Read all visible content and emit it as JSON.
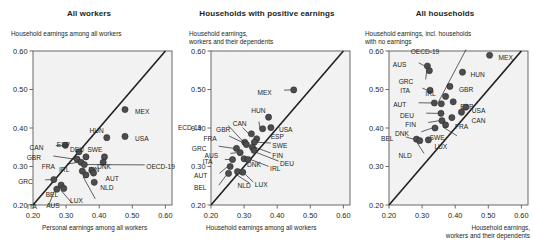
{
  "figure": {
    "axis_ticks": [
      "0.20",
      "0.30",
      "0.40",
      "0.50",
      "0.60"
    ],
    "axis_min": 0.2,
    "axis_max": 0.62,
    "marker_color": "#4d4d4f",
    "line_color": "#231f20",
    "plot_bg": "#f2f2f2"
  },
  "chart_data": [
    {
      "type": "scatter",
      "title": "All workers",
      "ylabel": "Household earnings among all workers",
      "xlabel": "Personal earnings among all workers",
      "xlim": [
        0.2,
        0.62
      ],
      "ylim": [
        0.2,
        0.6
      ],
      "xticks": [
        "0.20",
        "0.30",
        "0.40",
        "0.50",
        "0.60"
      ],
      "yticks": [
        "0.20",
        "0.30",
        "0.40",
        "0.50",
        "0.60"
      ],
      "grid": false,
      "legend": "none",
      "annotations": [
        "45-degree diagonal reference line"
      ],
      "points": [
        {
          "code": "MEX",
          "x": 0.478,
          "y": 0.448,
          "lx": 10,
          "ly": 2.5
        },
        {
          "code": "USA",
          "x": 0.478,
          "y": 0.378,
          "lx": 10,
          "ly": 2.5
        },
        {
          "code": "HUN",
          "x": 0.423,
          "y": 0.375,
          "lx": -3,
          "ly": -7
        },
        {
          "code": "SWE",
          "x": 0.416,
          "y": 0.325,
          "lx": -2,
          "ly": -7
        },
        {
          "code": "CAN",
          "x": 0.298,
          "y": 0.355,
          "lx": -22,
          "ly": 2.5
        },
        {
          "code": "ESP",
          "x": 0.339,
          "y": 0.338,
          "lx": -9,
          "ly": -7
        },
        {
          "code": "DEU",
          "x": 0.36,
          "y": 0.325,
          "lx": -2,
          "ly": -7
        },
        {
          "code": "FIN",
          "x": 0.412,
          "y": 0.311,
          "lx": -4,
          "ly": 7
        },
        {
          "code": "GBR",
          "x": 0.333,
          "y": 0.319,
          "lx": -36,
          "ly": -1
        },
        {
          "code": "FRA",
          "x": 0.345,
          "y": 0.311,
          "lx": -26,
          "ly": 4
        },
        {
          "code": "OECD-19",
          "x": 0.355,
          "y": 0.305,
          "lx": 62,
          "ly": 2.5
        },
        {
          "code": "DNK",
          "x": 0.378,
          "y": 0.29,
          "lx": 5,
          "ly": -4
        },
        {
          "code": "AUT",
          "x": 0.383,
          "y": 0.283,
          "lx": 12,
          "ly": 6
        },
        {
          "code": "IRL",
          "x": 0.349,
          "y": 0.288,
          "lx": -13,
          "ly": -1
        },
        {
          "code": "LUX",
          "x": 0.36,
          "y": 0.278,
          "lx": -3,
          "ly": 26
        },
        {
          "code": "NLD",
          "x": 0.385,
          "y": 0.259,
          "lx": 6,
          "ly": 5
        },
        {
          "code": "GRC",
          "x": 0.263,
          "y": 0.266,
          "lx": -21,
          "ly": 2.5
        },
        {
          "code": "BEL",
          "x": 0.285,
          "y": 0.252,
          "lx": -3,
          "ly": 10
        },
        {
          "code": "AUS",
          "x": 0.293,
          "y": 0.243,
          "lx": -4,
          "ly": 17
        },
        {
          "code": "ITA",
          "x": 0.272,
          "y": 0.241,
          "lx": -20,
          "ly": 17
        }
      ]
    },
    {
      "type": "scatter",
      "title": "Households with positive earnings",
      "ylabel": "Household earnings,\nworkers and their dependents",
      "xlabel": "Household earnings among all workers",
      "xlim": [
        0.2,
        0.62
      ],
      "ylim": [
        0.2,
        0.6
      ],
      "xticks": [
        "0.20",
        "0.30",
        "0.40",
        "0.50",
        "0.60"
      ],
      "yticks": [
        "0.20",
        "0.30",
        "0.40",
        "0.50",
        "0.60"
      ],
      "grid": false,
      "legend": "none",
      "annotations": [
        "45-degree diagonal reference line"
      ],
      "points": [
        {
          "code": "MEX",
          "x": 0.45,
          "y": 0.499,
          "lx": -22,
          "ly": 2.5
        },
        {
          "code": "HUN",
          "x": 0.374,
          "y": 0.428,
          "lx": -3,
          "ly": -7
        },
        {
          "code": "USA",
          "x": 0.381,
          "y": 0.401,
          "lx": 8,
          "ly": 2.5
        },
        {
          "code": "CAN",
          "x": 0.356,
          "y": 0.398,
          "lx": -16,
          "ly": -5
        },
        {
          "code": "GBR",
          "x": 0.322,
          "y": 0.385,
          "lx": -21,
          "ly": -4
        },
        {
          "code": "ESP",
          "x": 0.338,
          "y": 0.372,
          "lx": 14,
          "ly": -2
        },
        {
          "code": "SWE",
          "x": 0.331,
          "y": 0.363,
          "lx": 18,
          "ly": 3
        },
        {
          "code": "FRA",
          "x": 0.302,
          "y": 0.363,
          "lx": -28,
          "ly": -4
        },
        {
          "code": "OECD-19",
          "x": 0.307,
          "y": 0.357,
          "lx": -45,
          "ly": -17
        },
        {
          "code": "FIN",
          "x": 0.325,
          "y": 0.35,
          "lx": 20,
          "ly": 8
        },
        {
          "code": "DEU",
          "x": 0.33,
          "y": 0.342,
          "lx": 26,
          "ly": 13
        },
        {
          "code": "GRC",
          "x": 0.277,
          "y": 0.347,
          "lx": -30,
          "ly": 0
        },
        {
          "code": "AUS",
          "x": 0.288,
          "y": 0.336,
          "lx": -22,
          "ly": 3
        },
        {
          "code": "DNK",
          "x": 0.3,
          "y": 0.32,
          "lx": 3,
          "ly": 6
        },
        {
          "code": "IRL",
          "x": 0.312,
          "y": 0.318,
          "lx": 22,
          "ly": 9
        },
        {
          "code": "ITA",
          "x": 0.265,
          "y": 0.318,
          "lx": -20,
          "ly": 2
        },
        {
          "code": "AUT",
          "x": 0.258,
          "y": 0.3,
          "lx": -23,
          "ly": 9
        },
        {
          "code": "NLD",
          "x": 0.28,
          "y": 0.287,
          "lx": 0,
          "ly": 14
        },
        {
          "code": "LUX",
          "x": 0.296,
          "y": 0.285,
          "lx": 12,
          "ly": 12
        },
        {
          "code": "BEL",
          "x": 0.253,
          "y": 0.282,
          "lx": -22,
          "ly": 14
        }
      ]
    },
    {
      "type": "scatter",
      "title": "All households",
      "ylabel": "Household earnings, incl. households\nwith no earnings",
      "xlabel": "Household earnings,\nworkers and their dependents",
      "xlim": [
        0.2,
        0.62
      ],
      "ylim": [
        0.2,
        0.6
      ],
      "xticks": [
        "0.20",
        "0.30",
        "0.40",
        "0.50",
        "0.60"
      ],
      "yticks": [
        "0.20",
        "0.30",
        "0.40",
        "0.50",
        "0.60"
      ],
      "grid": false,
      "legend": "none",
      "annotations": [
        "45-degree diagonal reference line"
      ],
      "points": [
        {
          "code": "MEX",
          "x": 0.504,
          "y": 0.589,
          "lx": 9,
          "ly": 2.5
        },
        {
          "code": "AUS",
          "x": 0.316,
          "y": 0.561,
          "lx": -21,
          "ly": -1
        },
        {
          "code": "GRC",
          "x": 0.322,
          "y": 0.549,
          "lx": -16,
          "ly": 11
        },
        {
          "code": "HUN",
          "x": 0.422,
          "y": 0.545,
          "lx": 8,
          "ly": 2.5
        },
        {
          "code": "GBR",
          "x": 0.384,
          "y": 0.508,
          "lx": 9,
          "ly": 3
        },
        {
          "code": "ITA",
          "x": 0.324,
          "y": 0.498,
          "lx": -20,
          "ly": 0
        },
        {
          "code": "IRL",
          "x": 0.371,
          "y": 0.482,
          "lx": -10,
          "ly": -3
        },
        {
          "code": "OECD-19",
          "x": 0.358,
          "y": 0.463,
          "lx": -2,
          "ly": -52
        },
        {
          "code": "ESP",
          "x": 0.394,
          "y": 0.468,
          "lx": 7,
          "ly": 5
        },
        {
          "code": "AUT",
          "x": 0.337,
          "y": 0.465,
          "lx": -28,
          "ly": 2
        },
        {
          "code": "USA",
          "x": 0.432,
          "y": 0.454,
          "lx": 6,
          "ly": 3
        },
        {
          "code": "CAN",
          "x": 0.419,
          "y": 0.441,
          "lx": 10,
          "ly": 8
        },
        {
          "code": "DEU",
          "x": 0.357,
          "y": 0.438,
          "lx": -27,
          "ly": 2
        },
        {
          "code": "FRA",
          "x": 0.39,
          "y": 0.427,
          "lx": 3,
          "ly": 9
        },
        {
          "code": "FIN",
          "x": 0.36,
          "y": 0.419,
          "lx": -26,
          "ly": 4
        },
        {
          "code": "SWE",
          "x": 0.371,
          "y": 0.408,
          "lx": -1,
          "ly": 13
        },
        {
          "code": "DNK",
          "x": 0.339,
          "y": 0.4,
          "lx": -26,
          "ly": 6
        },
        {
          "code": "BEL",
          "x": 0.283,
          "y": 0.371,
          "lx": -23,
          "ly": 0
        },
        {
          "code": "NLD",
          "x": 0.293,
          "y": 0.367,
          "lx": -8,
          "ly": 15
        },
        {
          "code": "LUX",
          "x": 0.319,
          "y": 0.369,
          "lx": 6,
          "ly": 7
        }
      ]
    }
  ]
}
